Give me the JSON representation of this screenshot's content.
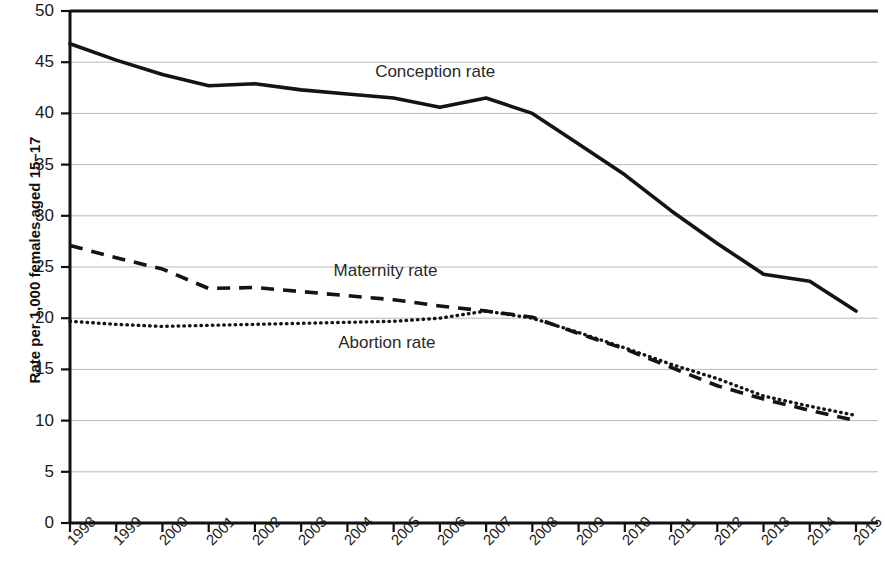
{
  "chart_data": {
    "type": "line",
    "title": "",
    "xlabel": "",
    "ylabel": "Rate per 1,000 females aged 15–17",
    "categories": [
      "1998",
      "1999",
      "2000",
      "2001",
      "2002",
      "2003",
      "2004",
      "2005",
      "2006",
      "2007",
      "2008",
      "2009",
      "2010",
      "2011",
      "2012",
      "2013",
      "2014",
      "2015"
    ],
    "x": [
      1998,
      1999,
      2000,
      2001,
      2002,
      2003,
      2004,
      2005,
      2006,
      2007,
      2008,
      2009,
      2010,
      2011,
      2012,
      2013,
      2014,
      2015
    ],
    "ylim": [
      0,
      50
    ],
    "xlim": [
      1998,
      2015
    ],
    "yticks": [
      0,
      5,
      10,
      15,
      20,
      25,
      30,
      35,
      40,
      45,
      50
    ],
    "ytick_labels": [
      "0",
      "5",
      "10",
      "15",
      "20",
      "25",
      "30",
      "35",
      "40",
      "45",
      "50"
    ],
    "grid": true,
    "grid_axis": "y",
    "legend": "inline-annotations",
    "series": [
      {
        "name": "Conception rate",
        "style": "solid",
        "color": "#141414",
        "label_position": "inline",
        "values": [
          46.8,
          45.2,
          43.8,
          42.7,
          42.9,
          42.3,
          41.9,
          41.5,
          40.6,
          41.5,
          40.0,
          37.0,
          34.0,
          30.5,
          27.3,
          24.3,
          23.6,
          20.7
        ]
      },
      {
        "name": "Maternity rate",
        "style": "dashed",
        "color": "#141414",
        "label_position": "inline",
        "values": [
          27.1,
          25.9,
          24.8,
          22.9,
          23.0,
          22.6,
          22.2,
          21.8,
          21.2,
          20.7,
          20.1,
          18.5,
          17.0,
          15.2,
          13.4,
          12.1,
          11.0,
          10.0
        ]
      },
      {
        "name": "Abortion rate",
        "style": "dotted",
        "color": "#141414",
        "label_position": "inline",
        "values": [
          19.7,
          19.4,
          19.2,
          19.3,
          19.4,
          19.5,
          19.6,
          19.7,
          20.0,
          20.7,
          20.0,
          18.6,
          17.1,
          15.5,
          14.1,
          12.4,
          11.4,
          10.5
        ]
      }
    ],
    "annotations": [
      {
        "text": "Conception rate",
        "x": 2004.6,
        "y": 44.0
      },
      {
        "text": "Maternity rate",
        "x": 2003.7,
        "y": 24.6
      },
      {
        "text": "Abortion rate",
        "x": 2003.8,
        "y": 17.6
      }
    ]
  }
}
